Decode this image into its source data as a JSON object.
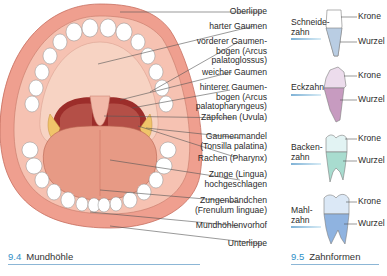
{
  "figure_left": {
    "number": "9.4",
    "title": "Mundhöhle",
    "labels": [
      {
        "text": "Oberlippe"
      },
      {
        "text": "harter Gaumen"
      },
      {
        "text": "vorderer Gaumen-\nbogen (Arcus\npalatoglossus)"
      },
      {
        "text": "weicher Gaumen"
      },
      {
        "text": "hinterer Gaumen-\nbogen (Arcus\npalatopharyngeus)"
      },
      {
        "text": "Zäpfchen (Uvula)"
      },
      {
        "text": "Gaumenmandel\n(Tonsilla palatina)"
      },
      {
        "text": "Rachen (Pharynx)"
      },
      {
        "text": "Zunge (Lingua)\nhochgeschlagen"
      },
      {
        "text": "Zungenbändchen\n(Frenulum linguae)"
      },
      {
        "text": "Mundhöhlenvorhof"
      },
      {
        "text": "Unterlippe"
      }
    ]
  },
  "figure_right": {
    "number": "9.5",
    "title": "Zahnformen",
    "teeth": [
      {
        "name": "Schneide-\nzahn",
        "crown": "Krone",
        "root": "Wurzel",
        "color": "#b9cde3"
      },
      {
        "name": "Eckzahn",
        "crown": "Krone",
        "root": "Wurzel",
        "color": "#c79bc0"
      },
      {
        "name": "Backen-\nzahn",
        "crown": "Krone",
        "root": "Wurzel",
        "color": "#a8dccf"
      },
      {
        "name": "Mahl-\nzahn",
        "crown": "Krone",
        "root": "Wurzel",
        "color": "#8fb3e0"
      }
    ]
  },
  "colors": {
    "lip": "#ef9f8f",
    "gum": "#f6c2b2",
    "palate": "#f8d4c4",
    "throat": "#9c2d2a",
    "tongue": "#e79a85",
    "tonsil": "#f0c46a",
    "accent": "#2f8fc7"
  }
}
